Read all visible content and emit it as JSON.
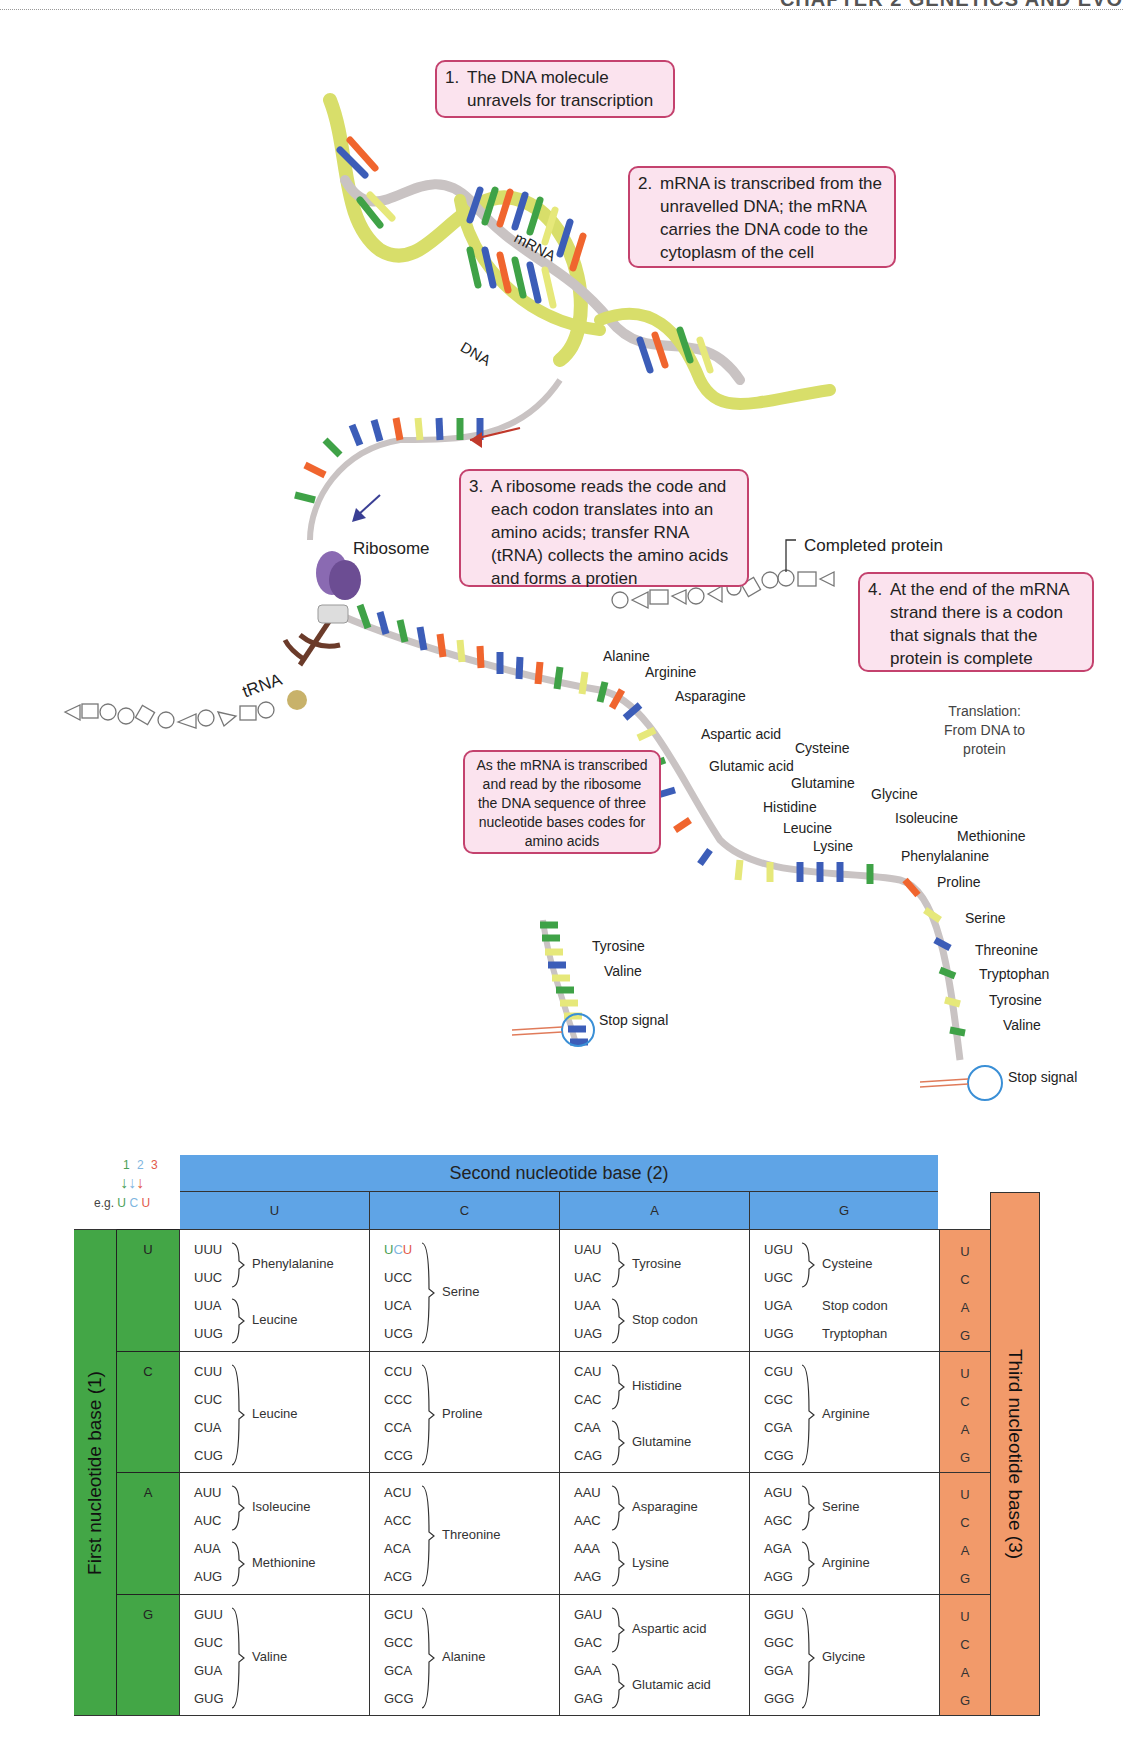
{
  "header": {
    "title": "CHAPTER 2  GENETICS AND EVO"
  },
  "callouts": {
    "c1": {
      "num": "1.",
      "text": "The DNA molecule unravels for transcription"
    },
    "c2": {
      "num": "2.",
      "text": "mRNA is transcribed from the unravelled DNA; the mRNA carries the DNA code to the cytoplasm of the cell"
    },
    "c3": {
      "num": "3.",
      "text": "A ribosome reads the code and each codon translates into an amino acids; transfer RNA (tRNA) collects the amino acids and forms a protien"
    },
    "c4": {
      "num": "4.",
      "text": "At the end of the mRNA strand there is a codon that signals that the protein is complete"
    },
    "c5": {
      "text": "As the mRNA is transcribed and read by the ribosome the DNA sequence of three nucleotide bases codes for amino acids"
    }
  },
  "labels": {
    "mrna": "mRNA",
    "dna": "DNA",
    "ribosome": "Ribosome",
    "trna": "tRNA",
    "completed_protein": "Completed protein",
    "translation_note": [
      "Translation:",
      "From DNA to",
      "protein"
    ],
    "stop_signal": "Stop signal"
  },
  "strand_amino_acids": [
    "Alanine",
    "Arginine",
    "Asparagine",
    "Aspartic acid",
    "Cysteine",
    "Glutamic acid",
    "Glutamine",
    "Glycine",
    "Histidine",
    "Isoleucine",
    "Leucine",
    "Lysine",
    "Methionine",
    "Phenylalanine",
    "Proline",
    "Serine",
    "Threonine",
    "Tryptophan",
    "Tyrosine",
    "Valine"
  ],
  "short_strand_amino_acids": [
    "Tyrosine",
    "Valine"
  ],
  "codon_table": {
    "title_second": "Second nucleotide base (2)",
    "title_first": "First nucleotide base (1)",
    "title_third": "Third nucleotide base (3)",
    "legend": {
      "nums": [
        "1",
        "2",
        "3"
      ],
      "eg": "e.g.",
      "example": [
        "U",
        "C",
        "U"
      ],
      "colors": [
        "#4aa055",
        "#7fb6e0",
        "#e25a4a"
      ]
    },
    "second_bases": [
      "U",
      "C",
      "A",
      "G"
    ],
    "first_bases": [
      "U",
      "C",
      "A",
      "G"
    ],
    "third_bases": [
      "U",
      "C",
      "A",
      "G"
    ],
    "rows": [
      {
        "first": "U",
        "cells": [
          {
            "codons": [
              "UUU",
              "UUC",
              "UUA",
              "UUG"
            ],
            "groups": [
              {
                "span": [
                  0,
                  1
                ],
                "aa": "Phenylalanine"
              },
              {
                "span": [
                  2,
                  3
                ],
                "aa": "Leucine"
              }
            ]
          },
          {
            "codons": [
              "UCU",
              "UCC",
              "UCA",
              "UCG"
            ],
            "groups": [
              {
                "span": [
                  0,
                  3
                ],
                "aa": "Serine"
              }
            ]
          },
          {
            "codons": [
              "UAU",
              "UAC",
              "UAA",
              "UAG"
            ],
            "groups": [
              {
                "span": [
                  0,
                  1
                ],
                "aa": "Tyrosine"
              },
              {
                "span": [
                  2,
                  3
                ],
                "aa": "Stop codon"
              }
            ]
          },
          {
            "codons": [
              "UGU",
              "UGC",
              "UGA",
              "UGG"
            ],
            "groups": [
              {
                "span": [
                  0,
                  1
                ],
                "aa": "Cysteine"
              },
              {
                "span": [
                  2,
                  2
                ],
                "aa": "Stop codon"
              },
              {
                "span": [
                  3,
                  3
                ],
                "aa": "Tryptophan"
              }
            ]
          }
        ]
      },
      {
        "first": "C",
        "cells": [
          {
            "codons": [
              "CUU",
              "CUC",
              "CUA",
              "CUG"
            ],
            "groups": [
              {
                "span": [
                  0,
                  3
                ],
                "aa": "Leucine"
              }
            ]
          },
          {
            "codons": [
              "CCU",
              "CCC",
              "CCA",
              "CCG"
            ],
            "groups": [
              {
                "span": [
                  0,
                  3
                ],
                "aa": "Proline"
              }
            ]
          },
          {
            "codons": [
              "CAU",
              "CAC",
              "CAA",
              "CAG"
            ],
            "groups": [
              {
                "span": [
                  0,
                  1
                ],
                "aa": "Histidine"
              },
              {
                "span": [
                  2,
                  3
                ],
                "aa": "Glutamine"
              }
            ]
          },
          {
            "codons": [
              "CGU",
              "CGC",
              "CGA",
              "CGG"
            ],
            "groups": [
              {
                "span": [
                  0,
                  3
                ],
                "aa": "Arginine"
              }
            ]
          }
        ]
      },
      {
        "first": "A",
        "cells": [
          {
            "codons": [
              "AUU",
              "AUC",
              "AUA",
              "AUG"
            ],
            "groups": [
              {
                "span": [
                  0,
                  1
                ],
                "aa": "Isoleucine"
              },
              {
                "span": [
                  2,
                  3
                ],
                "aa": "Methionine"
              }
            ]
          },
          {
            "codons": [
              "ACU",
              "ACC",
              "ACA",
              "ACG"
            ],
            "groups": [
              {
                "span": [
                  0,
                  3
                ],
                "aa": "Threonine"
              }
            ]
          },
          {
            "codons": [
              "AAU",
              "AAC",
              "AAA",
              "AAG"
            ],
            "groups": [
              {
                "span": [
                  0,
                  1
                ],
                "aa": "Asparagine"
              },
              {
                "span": [
                  2,
                  3
                ],
                "aa": "Lysine"
              }
            ]
          },
          {
            "codons": [
              "AGU",
              "AGC",
              "AGA",
              "AGG"
            ],
            "groups": [
              {
                "span": [
                  0,
                  1
                ],
                "aa": "Serine"
              },
              {
                "span": [
                  2,
                  3
                ],
                "aa": "Arginine"
              }
            ]
          }
        ]
      },
      {
        "first": "G",
        "cells": [
          {
            "codons": [
              "GUU",
              "GUC",
              "GUA",
              "GUG"
            ],
            "groups": [
              {
                "span": [
                  0,
                  3
                ],
                "aa": "Valine"
              }
            ]
          },
          {
            "codons": [
              "GCU",
              "GCC",
              "GCA",
              "GCG"
            ],
            "groups": [
              {
                "span": [
                  0,
                  3
                ],
                "aa": "Alanine"
              }
            ]
          },
          {
            "codons": [
              "GAU",
              "GAC",
              "GAA",
              "GAG"
            ],
            "groups": [
              {
                "span": [
                  0,
                  1
                ],
                "aa": "Aspartic acid"
              },
              {
                "span": [
                  2,
                  3
                ],
                "aa": "Glutamic acid"
              }
            ]
          },
          {
            "codons": [
              "GGU",
              "GGC",
              "GGA",
              "GGG"
            ],
            "groups": [
              {
                "span": [
                  0,
                  3
                ],
                "aa": "Glycine"
              }
            ]
          }
        ]
      }
    ]
  },
  "colors": {
    "callout_bg": "#fbe3ee",
    "callout_border": "#c4426e",
    "header_blue": "#5fa4e6",
    "first_green": "#43a646",
    "third_orange": "#f29a6a",
    "base_green": "#3fa247",
    "base_blue": "#3c5db8",
    "base_orange": "#f0652e",
    "base_yellow": "#e6e87a",
    "backbone_yellow": "#d8de6a",
    "backbone_grey": "#c9c3c3",
    "ribosome": "#6c4d93",
    "trna": "#6b3b2a"
  }
}
